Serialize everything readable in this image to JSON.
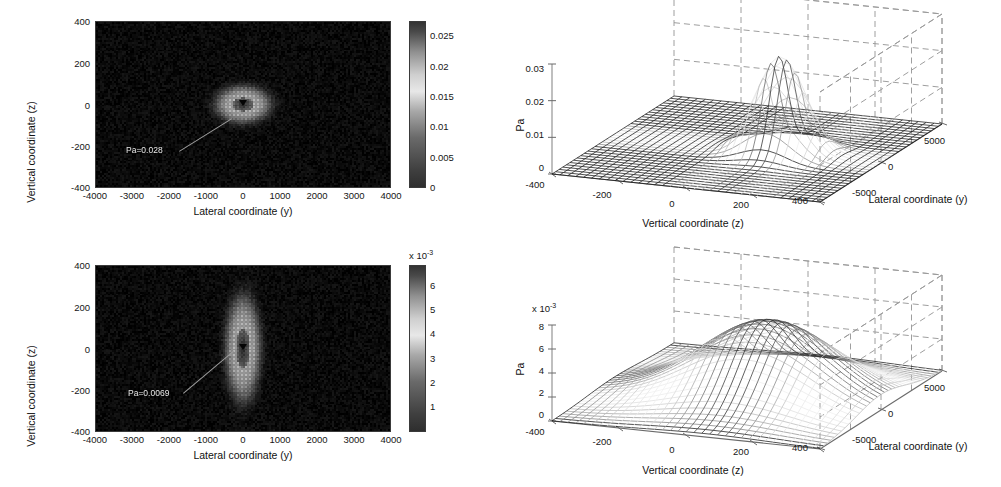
{
  "figure": {
    "background": "#ffffff",
    "units": "Pa"
  },
  "chart_data": [
    {
      "id": "heatmap-top-left",
      "type": "heatmap",
      "title": "",
      "xlabel": "Lateral coordinate (y)",
      "ylabel": "Vertical coordinate (z)",
      "xticks": [
        "-4000",
        "-3000",
        "-2000",
        "-1000",
        "0",
        "1000",
        "2000",
        "3000",
        "4000"
      ],
      "xtick_values": [
        -4000,
        -3000,
        -2000,
        -1000,
        0,
        1000,
        2000,
        3000,
        4000
      ],
      "yticks": [
        "400",
        "200",
        "0",
        "-200",
        "-400"
      ],
      "ytick_values": [
        400,
        200,
        0,
        -200,
        -400
      ],
      "xlim": [
        -4000,
        4000
      ],
      "ylim": [
        -400,
        400
      ],
      "colormap": "gray",
      "annotation": "Pa=0.028",
      "peak_value": 0.028,
      "peak_x": 0,
      "peak_y": 0,
      "sigma_x": 520,
      "sigma_y": 62,
      "field_shape": "ring",
      "colorbar": {
        "ticks": [
          "0",
          "0.005",
          "0.01",
          "0.015",
          "0.02",
          "0.025"
        ],
        "tick_values": [
          0,
          0.005,
          0.01,
          0.015,
          0.02,
          0.025
        ],
        "min": 0,
        "max": 0.0275,
        "exponent_label": "",
        "position": "right"
      }
    },
    {
      "id": "surface-top-right",
      "type": "surface",
      "title": "",
      "xlabel": "Vertical coordinate (z)",
      "ylabel": "Lateral coordinate (y)",
      "zlabel": "Pa",
      "xticks": [
        "-400",
        "-200",
        "0",
        "200",
        "400"
      ],
      "xtick_values": [
        -400,
        -200,
        0,
        200,
        400
      ],
      "yticks": [
        "-5000",
        "0",
        "5000"
      ],
      "ytick_values": [
        -5000,
        0,
        5000
      ],
      "zticks": [
        "0",
        "0.01",
        "0.02",
        "0.03"
      ],
      "ztick_values": [
        0,
        0.01,
        0.02,
        0.03
      ],
      "zlim": [
        0,
        0.032
      ],
      "exponent_label": "",
      "peak_value": 0.028,
      "peak_x": 100,
      "peak_y": 0,
      "sigma_x": 70,
      "sigma_y": 900,
      "grid": true
    },
    {
      "id": "heatmap-bottom-left",
      "type": "heatmap",
      "title": "",
      "xlabel": "Lateral coordinate (y)",
      "ylabel": "Vertical coordinate (z)",
      "xticks": [
        "-4000",
        "-3000",
        "-2000",
        "-1000",
        "0",
        "1000",
        "2000",
        "3000",
        "4000"
      ],
      "xtick_values": [
        -4000,
        -3000,
        -2000,
        -1000,
        0,
        1000,
        2000,
        3000,
        4000
      ],
      "yticks": [
        "400",
        "200",
        "0",
        "-200",
        "-400"
      ],
      "ytick_values": [
        400,
        200,
        0,
        -200,
        -400
      ],
      "xlim": [
        -4000,
        4000
      ],
      "ylim": [
        -400,
        400
      ],
      "colormap": "gray",
      "annotation": "Pa=0.0069",
      "peak_value": 0.0069,
      "peak_x": 0,
      "peak_y": 0,
      "sigma_x": 330,
      "sigma_y": 175,
      "field_shape": "ring",
      "colorbar": {
        "ticks": [
          "1",
          "2",
          "3",
          "4",
          "5",
          "6"
        ],
        "tick_values": [
          1,
          2,
          3,
          4,
          5,
          6
        ],
        "min": 0,
        "max": 6.9,
        "exponent_label": "x 10",
        "exponent_power": "-3",
        "position": "right"
      }
    },
    {
      "id": "surface-bottom-right",
      "type": "surface",
      "title": "",
      "xlabel": "Vertical coordinate (z)",
      "ylabel": "Lateral coordinate (y)",
      "zlabel": "Pa",
      "xticks": [
        "-400",
        "-200",
        "0",
        "200",
        "400"
      ],
      "xtick_values": [
        -400,
        -200,
        0,
        200,
        400
      ],
      "yticks": [
        "-5000",
        "0",
        "5000"
      ],
      "ytick_values": [
        -5000,
        0,
        5000
      ],
      "zticks": [
        "0",
        "2",
        "4",
        "6",
        "8"
      ],
      "ztick_values": [
        0,
        2,
        4,
        6,
        8
      ],
      "zlim": [
        0,
        8.6
      ],
      "exponent_label": "x 10",
      "exponent_power": "-3",
      "peak_value": 6.9,
      "peak_x": 60,
      "peak_y": 0,
      "sigma_x": 190,
      "sigma_y": 2400,
      "grid": true
    }
  ]
}
